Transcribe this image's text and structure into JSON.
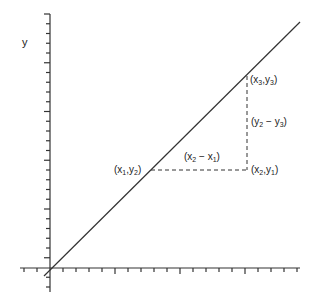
{
  "diagram": {
    "type": "slope-triangle",
    "axis_label_y": "y",
    "points": {
      "p1": {
        "label_main": "(x",
        "sub_a": "1",
        "mid": ",y",
        "sub_b": "2",
        "close": ")",
        "text": "(x1,y2)"
      },
      "p2": {
        "label_main": "(x",
        "sub_a": "2",
        "mid": ",y",
        "sub_b": "1",
        "close": ")",
        "text": "(x2,y1)"
      },
      "p3": {
        "label_main": "(x",
        "sub_a": "3",
        "mid": ",y",
        "sub_b": "3",
        "close": ")",
        "text": "(x3,y3)"
      }
    },
    "run_label": {
      "a": "(x",
      "sa": "2",
      "m": " − x",
      "sb": "1",
      "c": ")",
      "text": "(x2 − x1)"
    },
    "rise_label": {
      "a": "(y",
      "sa": "2",
      "m": " − y",
      "sb": "3",
      "c": ")",
      "text": "(y2 − y3)"
    },
    "colors": {
      "line": "#333333",
      "text": "#222222",
      "background": "#ffffff"
    }
  }
}
